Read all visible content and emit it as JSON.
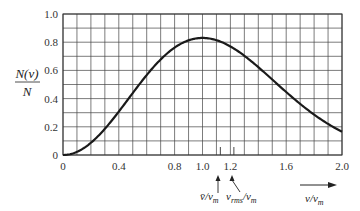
{
  "chart_data": {
    "type": "line",
    "title": "",
    "function": "N(v)/N = (4/sqrt(pi)) (v/v_m)^2 exp(-(v/v_m)^2)",
    "xlabel": "v/v_m",
    "ylabel_numerator": "N(v)",
    "ylabel_denominator": "N",
    "xlim": [
      0,
      2.0
    ],
    "ylim": [
      0,
      1.0
    ],
    "x_ticks": [
      "0",
      "0.4",
      "0.8",
      "1.0",
      "1.2",
      "1.6",
      "2.0"
    ],
    "x_tick_values": [
      0,
      0.4,
      0.8,
      1.0,
      1.2,
      1.6,
      2.0
    ],
    "y_ticks": [
      "0",
      "0.2",
      "0.4",
      "0.6",
      "0.8",
      "1.0"
    ],
    "y_tick_values": [
      0,
      0.2,
      0.4,
      0.6,
      0.8,
      1.0
    ],
    "grid": true,
    "grid_x_step": 0.1,
    "grid_y_step": 0.1,
    "series": [
      {
        "name": "Maxwell speed distribution",
        "x": [
          0,
          0.1,
          0.2,
          0.3,
          0.4,
          0.5,
          0.6,
          0.7,
          0.8,
          0.9,
          1.0,
          1.1,
          1.2,
          1.3,
          1.4,
          1.5,
          1.6,
          1.7,
          1.8,
          1.9,
          2.0
        ],
        "values": [
          0,
          0.022,
          0.087,
          0.186,
          0.308,
          0.439,
          0.563,
          0.675,
          0.759,
          0.809,
          0.83,
          0.815,
          0.77,
          0.703,
          0.621,
          0.534,
          0.446,
          0.363,
          0.286,
          0.221,
          0.165
        ]
      }
    ],
    "annotations": [
      {
        "label": "v̄/v_m",
        "x": 1.128,
        "type": "arrow-marker"
      },
      {
        "label": "v_rms/v_m",
        "x": 1.225,
        "type": "arrow-marker"
      },
      {
        "label": "v/v_m",
        "type": "axis-arrow"
      }
    ]
  },
  "labels": {
    "ylabel_num": "N(v)",
    "ylabel_den": "N",
    "vbar_main": "v̄/v",
    "vbar_sub": "m",
    "vrms_main": "v",
    "vrms_sub1": "rms",
    "vrms_mid": "/v",
    "vrms_sub2": "m",
    "axis_main": "v/v",
    "axis_sub": "m"
  }
}
